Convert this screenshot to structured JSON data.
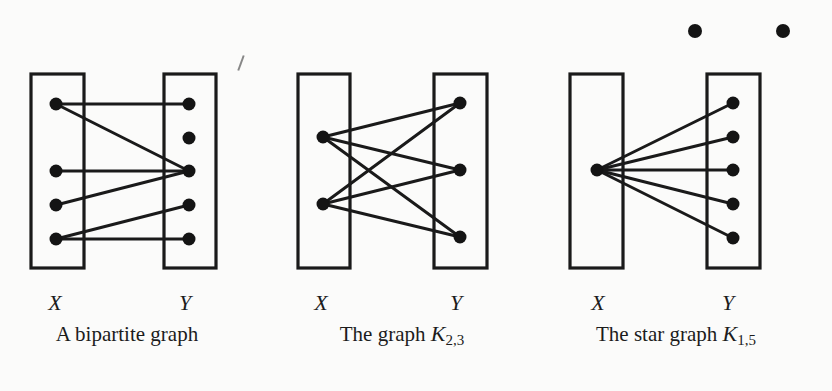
{
  "figure": {
    "colors": {
      "ink": "#1a1a1a",
      "background": "#fbfbfa"
    },
    "stray_nodes": [
      {
        "x": 695,
        "y": 31
      },
      {
        "x": 783,
        "y": 31
      }
    ],
    "graphs": [
      {
        "id": "bipartite",
        "caption_text": "A bipartite graph",
        "caption_math": "",
        "caption_sub": "",
        "x_label": "X",
        "y_label": "Y",
        "x_box": {
          "x": 31,
          "y": 74,
          "w": 53,
          "h": 194
        },
        "y_box": {
          "x": 164,
          "y": 74,
          "w": 52,
          "h": 194
        },
        "x_nodes": [
          {
            "x": 56,
            "y": 104
          },
          {
            "x": 56,
            "y": 171
          },
          {
            "x": 56,
            "y": 205
          },
          {
            "x": 56,
            "y": 239
          }
        ],
        "y_nodes": [
          {
            "x": 189,
            "y": 104
          },
          {
            "x": 189,
            "y": 138
          },
          {
            "x": 189,
            "y": 171
          },
          {
            "x": 189,
            "y": 205
          },
          {
            "x": 189,
            "y": 239
          }
        ],
        "edges": [
          [
            0,
            0
          ],
          [
            0,
            2
          ],
          [
            1,
            2
          ],
          [
            2,
            2
          ],
          [
            3,
            3
          ],
          [
            3,
            4
          ]
        ],
        "x_label_pos": {
          "x": 55,
          "y": 292
        },
        "y_label_pos": {
          "x": 185,
          "y": 292
        },
        "caption_pos": {
          "x": 127,
          "y": 323
        }
      },
      {
        "id": "k23",
        "caption_text": "The graph ",
        "caption_math": "K",
        "caption_sub": "2,3",
        "x_label": "X",
        "y_label": "Y",
        "x_box": {
          "x": 298,
          "y": 74,
          "w": 52,
          "h": 194
        },
        "y_box": {
          "x": 434,
          "y": 74,
          "w": 53,
          "h": 194
        },
        "x_nodes": [
          {
            "x": 323,
            "y": 137
          },
          {
            "x": 323,
            "y": 204
          }
        ],
        "y_nodes": [
          {
            "x": 460,
            "y": 103
          },
          {
            "x": 460,
            "y": 170
          },
          {
            "x": 460,
            "y": 237
          }
        ],
        "edges": [
          [
            0,
            0
          ],
          [
            0,
            1
          ],
          [
            0,
            2
          ],
          [
            1,
            0
          ],
          [
            1,
            1
          ],
          [
            1,
            2
          ]
        ],
        "x_label_pos": {
          "x": 321,
          "y": 292
        },
        "y_label_pos": {
          "x": 456,
          "y": 292
        },
        "caption_pos": {
          "x": 402,
          "y": 323
        }
      },
      {
        "id": "k15",
        "caption_text": "The star graph ",
        "caption_math": "K",
        "caption_sub": "1,5",
        "x_label": "X",
        "y_label": "Y",
        "x_box": {
          "x": 570,
          "y": 74,
          "w": 53,
          "h": 194
        },
        "y_box": {
          "x": 707,
          "y": 74,
          "w": 53,
          "h": 194
        },
        "x_nodes": [
          {
            "x": 597,
            "y": 170
          }
        ],
        "y_nodes": [
          {
            "x": 733,
            "y": 103
          },
          {
            "x": 733,
            "y": 137
          },
          {
            "x": 733,
            "y": 170
          },
          {
            "x": 733,
            "y": 204
          },
          {
            "x": 733,
            "y": 238
          }
        ],
        "edges": [
          [
            0,
            0
          ],
          [
            0,
            1
          ],
          [
            0,
            2
          ],
          [
            0,
            3
          ],
          [
            0,
            4
          ]
        ],
        "x_label_pos": {
          "x": 598,
          "y": 292
        },
        "y_label_pos": {
          "x": 728,
          "y": 292
        },
        "caption_pos": {
          "x": 676,
          "y": 323
        }
      }
    ]
  }
}
